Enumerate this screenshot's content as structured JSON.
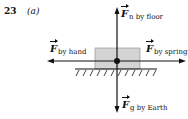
{
  "problem": {
    "number": "23",
    "part": "(a)"
  },
  "diagram": {
    "type": "free-body diagram",
    "object": "block on floor",
    "colors": {
      "block_fill": "#d4d4d4",
      "line": "#111111"
    },
    "forces": [
      {
        "id": "normal",
        "symbol": "F",
        "subscript": "n by floor",
        "direction": "up"
      },
      {
        "id": "hand",
        "symbol": "F",
        "subscript": "by hand",
        "direction": "left"
      },
      {
        "id": "spring",
        "symbol": "F",
        "subscript": "by spring",
        "direction": "right"
      },
      {
        "id": "gravity",
        "symbol": "F",
        "subscript": "g by Earth",
        "direction": "down"
      }
    ]
  }
}
